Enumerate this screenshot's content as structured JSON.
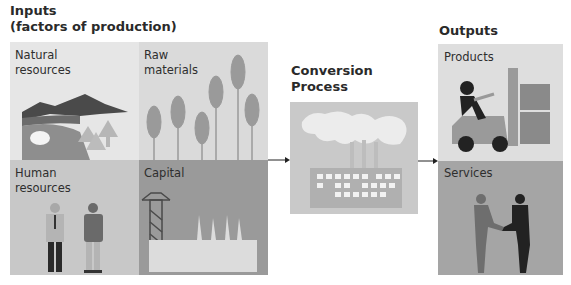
{
  "inputs": {
    "title_line1": "Inputs",
    "title_line2": "(factors of production)",
    "cells": [
      {
        "label_line1": "Natural",
        "label_line2": "resources",
        "icon": "landscape-icon",
        "bg": "#e6e6e6"
      },
      {
        "label_line1": "Raw",
        "label_line2": "materials",
        "icon": "wheat-icon",
        "bg": "#dadada"
      },
      {
        "label_line1": "Human",
        "label_line2": "resources",
        "icon": "people-icon",
        "bg": "#c8c8c8"
      },
      {
        "label_line1": "Capital",
        "label_line2": "",
        "icon": "factory-icon",
        "bg": "#9a9a9a"
      }
    ]
  },
  "conversion": {
    "title_line1": "Conversion",
    "title_line2": "Process",
    "icon": "smoking-factory-icon",
    "bg": "#c9c9c9"
  },
  "outputs": {
    "title": "Outputs",
    "cells": [
      {
        "label": "Products",
        "icon": "forklift-icon",
        "bg": "#dedede"
      },
      {
        "label": "Services",
        "icon": "handshake-icon",
        "bg": "#a5a5a5"
      }
    ]
  },
  "arrows": [
    "inputs-to-conversion",
    "conversion-to-outputs"
  ]
}
